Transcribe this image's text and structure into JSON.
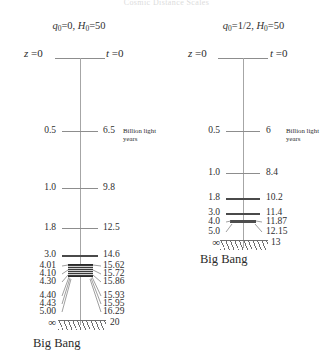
{
  "figure": {
    "top_title": "Cosmic Distance Scales",
    "units_caption_line1": "Billion light",
    "units_caption_line2": "years",
    "big_bang_label": "Big Bang",
    "infinity_symbol": "∞",
    "axis_color": "#a6a6a6",
    "text_color": "#2b2b2b",
    "band_color": "#4d4d4d"
  },
  "panels": [
    {
      "id": "open-universe",
      "header": {
        "q_symbol": "q",
        "q_sub": "0",
        "q_value": "0",
        "sep": ", ",
        "h_symbol": "H",
        "h_sub": "0",
        "h_value": "50"
      },
      "top_row": {
        "z_symbol": "z",
        "z_value": "0",
        "t_symbol": "t",
        "t_value": "0"
      },
      "rows": [
        {
          "z": "0.5",
          "t": "6.5",
          "kind": "tick"
        },
        {
          "z": "1.0",
          "t": "9.8",
          "kind": "tick"
        },
        {
          "z": "1.8",
          "t": "12.5",
          "kind": "tick"
        },
        {
          "z": "3.0",
          "t": "14.6",
          "kind": "tick"
        },
        {
          "z": "4.01",
          "t": "15.62",
          "kind": "leader"
        },
        {
          "z": "4.10",
          "t": "15.72",
          "kind": "leader"
        },
        {
          "z": "4.30",
          "t": "15.86",
          "kind": "leader"
        },
        {
          "z": "4.40",
          "t": "15.93",
          "kind": "leader"
        },
        {
          "z": "4.43",
          "t": "15.95",
          "kind": "leader"
        },
        {
          "z": "5.00",
          "t": "16.29",
          "kind": "leader"
        },
        {
          "z": "∞",
          "t": "20",
          "kind": "barrier"
        }
      ]
    },
    {
      "id": "flat-universe",
      "header": {
        "q_symbol": "q",
        "q_sub": "0",
        "q_value": "1/2",
        "sep": ", ",
        "h_symbol": "H",
        "h_sub": "0",
        "h_value": "50"
      },
      "top_row": {
        "z_symbol": "z",
        "z_value": "0",
        "t_symbol": "t",
        "t_value": "0"
      },
      "rows": [
        {
          "z": "0.5",
          "t": "6",
          "kind": "tick"
        },
        {
          "z": "1.0",
          "t": "8.4",
          "kind": "tick"
        },
        {
          "z": "1.8",
          "t": "10.2",
          "kind": "tick"
        },
        {
          "z": "3.0",
          "t": "11.4",
          "kind": "tick"
        },
        {
          "z": "4.0",
          "t": "11.87",
          "kind": "leader"
        },
        {
          "z": "5.0",
          "t": "12.15",
          "kind": "leader"
        },
        {
          "z": "∞",
          "t": "13",
          "kind": "barrier"
        }
      ]
    }
  ]
}
